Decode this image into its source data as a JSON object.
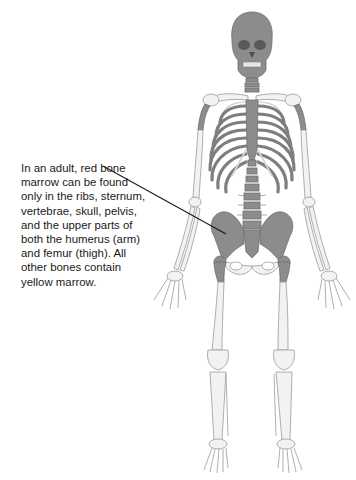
{
  "figure": {
    "callout": {
      "text": "In an adult, red bone marrow can be found only in the ribs, sternum, vertebrae, skull, pelvis, and the upper parts of both the humerus (arm) and femur (thigh). All other bones contain yellow marrow."
    },
    "colors": {
      "red_marrow_bone": "#8c8c8c",
      "yellow_marrow_bone": "#f2f2f2",
      "bone_outline": "#9a9a9a",
      "leader_line": "#1a1a1a",
      "background": "#ffffff"
    },
    "highlighted_bones": [
      "skull",
      "ribs",
      "sternum",
      "vertebrae",
      "pelvis",
      "upper humerus",
      "upper femur"
    ]
  }
}
